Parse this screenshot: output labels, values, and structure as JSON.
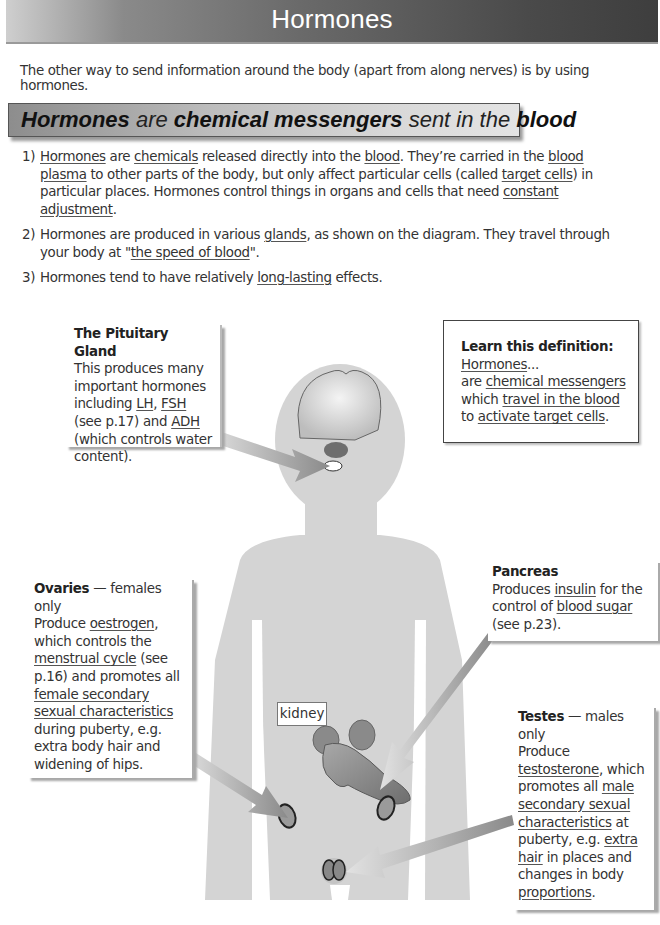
{
  "header": {
    "title": "Hormones"
  },
  "intro": "The other way to send information around the body (apart from along nerves) is by using hormones.",
  "banner": {
    "parts": [
      {
        "text": "Hormones",
        "bold": true
      },
      {
        "text": " are ",
        "bold": false
      },
      {
        "text": "chemical messengers",
        "bold": true
      },
      {
        "text": " sent in the ",
        "bold": false
      },
      {
        "text": "blood",
        "bold": true
      }
    ]
  },
  "points": [
    {
      "number": "1)",
      "segments": [
        {
          "t": "Hormones",
          "u": true
        },
        {
          "t": " are "
        },
        {
          "t": "chemicals",
          "u": true
        },
        {
          "t": " released directly into the "
        },
        {
          "t": "blood",
          "u": true
        },
        {
          "t": ".  They’re carried in the "
        },
        {
          "t": "blood plasma",
          "u": true
        },
        {
          "t": " to other parts of the body, but only affect particular cells (called "
        },
        {
          "t": "target cells",
          "u": true
        },
        {
          "t": ") in particular places.  Hormones control things in organs and cells that need "
        },
        {
          "t": "constant adjustment",
          "u": true
        },
        {
          "t": "."
        }
      ]
    },
    {
      "number": "2)",
      "segments": [
        {
          "t": "Hormones are produced in various "
        },
        {
          "t": "glands",
          "u": true
        },
        {
          "t": ", as shown on the diagram. They travel through your body at \""
        },
        {
          "t": "the speed of blood",
          "u": true
        },
        {
          "t": "\"."
        }
      ]
    },
    {
      "number": "3)",
      "segments": [
        {
          "t": "Hormones tend to have relatively "
        },
        {
          "t": "long-lasting",
          "u": true
        },
        {
          "t": " effects."
        }
      ]
    }
  ],
  "callouts": {
    "pituitary": {
      "heading": "The Pituitary Gland",
      "segments": [
        {
          "t": "This produces many important hormones including "
        },
        {
          "t": "LH",
          "u": true
        },
        {
          "t": ", "
        },
        {
          "t": "FSH",
          "u": true
        },
        {
          "t": " (see p.17) and "
        },
        {
          "t": "ADH",
          "u": true
        },
        {
          "t": " (which controls water content)."
        }
      ]
    },
    "ovaries": {
      "heading": "Ovaries",
      "heading_suffix": " — females only",
      "segments": [
        {
          "t": "Produce "
        },
        {
          "t": "oestrogen",
          "u": true
        },
        {
          "t": ", which controls the "
        },
        {
          "t": "menstrual cycle",
          "u": true
        },
        {
          "t": " (see p.16) and promotes all "
        },
        {
          "t": "female secondary sexual characteristics",
          "u": true
        },
        {
          "t": " during puberty, e.g. extra body hair and widening of hips."
        }
      ]
    },
    "pancreas": {
      "heading": "Pancreas",
      "segments": [
        {
          "t": "Produces "
        },
        {
          "t": "insulin",
          "u": true
        },
        {
          "t": " for the control of "
        },
        {
          "t": "blood sugar",
          "u": true
        },
        {
          "t": " (see p.23)."
        }
      ]
    },
    "testes": {
      "heading": "Testes",
      "heading_suffix": " — males only",
      "segments": [
        {
          "t": "Produce "
        },
        {
          "t": "testosterone",
          "u": true
        },
        {
          "t": ", which promotes all "
        },
        {
          "t": "male secondary sexual characteristics",
          "u": true
        },
        {
          "t": " at puberty, e.g. "
        },
        {
          "t": "extra hair",
          "u": true
        },
        {
          "t": " in places and changes in body "
        },
        {
          "t": "proportions",
          "u": true
        },
        {
          "t": "."
        }
      ]
    }
  },
  "definition": {
    "heading": "Learn this definition:",
    "lines": [
      [
        {
          "t": "Hormones",
          "u": true
        },
        {
          "t": "..."
        }
      ],
      [
        {
          "t": "are "
        },
        {
          "t": "chemical messengers",
          "u": true
        }
      ],
      [
        {
          "t": "which "
        },
        {
          "t": "travel in the blood",
          "u": true
        }
      ],
      [
        {
          "t": "to "
        },
        {
          "t": "activate target cells",
          "u": true
        },
        {
          "t": "."
        }
      ]
    ]
  },
  "diagram": {
    "kidney_label": "kidney",
    "colors": {
      "silhouette": "#d4d4d4",
      "arrow": "#7a7a7a",
      "organ": "#8f8f8f"
    }
  }
}
